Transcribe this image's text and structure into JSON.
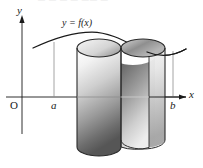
{
  "figure": {
    "kind": "math-diagram",
    "top_cropped_text": "— —  —   —   ——  —",
    "background_color": "#ffffff",
    "ink_color": "#1a1a1a"
  },
  "axes": {
    "y_label": "y",
    "x_label": "x",
    "origin_label": "O",
    "x_axis_y": 97,
    "y_axis_x": 22,
    "x_axis_start": 6,
    "x_axis_end": 190,
    "y_axis_top": 18,
    "y_axis_bottom": 134
  },
  "ticks": [
    {
      "name": "a",
      "label": "a",
      "x": 54
    },
    {
      "name": "b",
      "label": "b",
      "x": 173
    }
  ],
  "curve": {
    "label": "y = f(x)",
    "label_x": 62,
    "label_y": 17,
    "stroke": "#1a1a1a",
    "path": "M 36 47 C 56 38, 74 32, 92 32 C 112 32, 130 44, 146 51 C 158 56, 170 56, 182 50"
  },
  "shell": {
    "name": "cylindrical-shell",
    "outer_center_x": 99,
    "inner_center_x": 133,
    "top_y": 48,
    "bottom_y": 147,
    "ellipse_rx": 22,
    "ellipse_ry": 9,
    "fill_light": "#fdfdfd",
    "fill_mid": "#b8b8b8",
    "fill_dark": "#4a4a4a",
    "stroke": "#2a2a2a"
  }
}
